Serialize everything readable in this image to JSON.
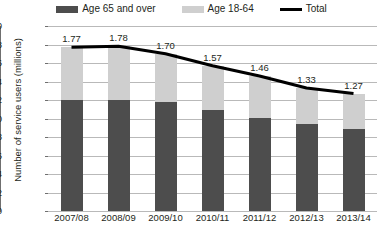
{
  "legend": {
    "items": [
      {
        "label": "Age 65 and over",
        "type": "bar",
        "color": "#4d4d4d",
        "icon": "legend-swatch-dark"
      },
      {
        "label": "Age 18-64",
        "type": "bar",
        "color": "#cfcfcf",
        "icon": "legend-swatch-light"
      },
      {
        "label": "Total",
        "type": "line",
        "color": "#000000",
        "icon": "legend-line-black"
      }
    ]
  },
  "axis": {
    "y_title": "Number of service users (millions)",
    "y_ticks": [
      "2.0",
      "1.8",
      "1.6",
      "1.4",
      "1.2",
      "1.0",
      "0.8",
      "0.6",
      "0.4",
      "0.2",
      "0.0"
    ]
  },
  "chart_data": {
    "type": "bar",
    "title": "",
    "subtitle": "",
    "xlabel": "",
    "ylabel": "Number of service users (millions)",
    "ylim": [
      0.0,
      2.0
    ],
    "ytick_step": 0.2,
    "grid": true,
    "stacked": true,
    "legend_position": "top-center",
    "categories": [
      "2007/08",
      "2008/09",
      "2009/10",
      "2010/11",
      "2011/12",
      "2012/13",
      "2013/14"
    ],
    "series": [
      {
        "name": "Age 65 and over",
        "type": "bar",
        "color": "#4d4d4d",
        "values": [
          1.2,
          1.2,
          1.18,
          1.09,
          1.01,
          0.94,
          0.89
        ]
      },
      {
        "name": "Age 18-64",
        "type": "bar",
        "color": "#cfcfcf",
        "values": [
          0.57,
          0.58,
          0.52,
          0.48,
          0.45,
          0.39,
          0.38
        ]
      },
      {
        "name": "Total",
        "type": "line",
        "color": "#000000",
        "values": [
          1.77,
          1.78,
          1.7,
          1.57,
          1.46,
          1.33,
          1.27
        ],
        "data_labels": [
          "1.77",
          "1.78",
          "1.70",
          "1.57",
          "1.46",
          "1.33",
          "1.27"
        ]
      }
    ]
  }
}
